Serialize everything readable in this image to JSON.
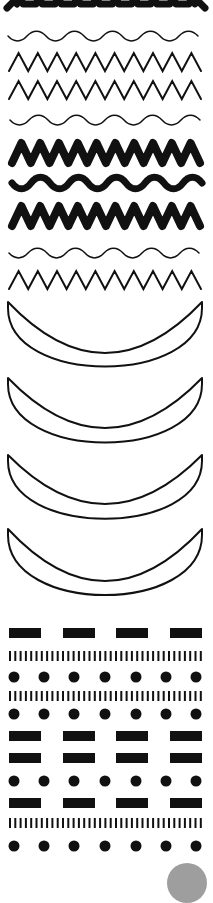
{
  "canvas": {
    "width": 213,
    "height": 875,
    "background": "#ffffff",
    "ink": "#111111",
    "accent_gray": "#9e9e9e"
  },
  "patterns": [
    {
      "id": "thick-zigzag-cut",
      "type": "zigzag",
      "y": 10,
      "amp": 14,
      "periods": 10,
      "stroke": 7,
      "x0": 11,
      "x1": 201,
      "clipTop": true
    },
    {
      "id": "thin-wave-1",
      "type": "wave",
      "y": 36,
      "amp": 5,
      "periods": 5,
      "stroke": 1.5,
      "x0": 8,
      "x1": 198
    },
    {
      "id": "thin-zigzag-1",
      "type": "zigzag",
      "y": 62,
      "amp": 9,
      "periods": 10,
      "stroke": 2,
      "x0": 9,
      "x1": 201
    },
    {
      "id": "thin-zigzag-2",
      "type": "zigzag",
      "y": 90,
      "amp": 9,
      "periods": 10,
      "stroke": 2,
      "x0": 9,
      "x1": 201
    },
    {
      "id": "thin-wave-2",
      "type": "wave",
      "y": 120,
      "amp": 5,
      "periods": 5,
      "stroke": 1.5,
      "x0": 10,
      "x1": 200
    },
    {
      "id": "thick-zigzag-1",
      "type": "zigzag",
      "y": 153,
      "amp": 10,
      "periods": 10,
      "stroke": 8,
      "x0": 12,
      "x1": 200
    },
    {
      "id": "thick-wave",
      "type": "wave",
      "y": 183,
      "amp": 6,
      "periods": 5,
      "stroke": 7,
      "x0": 12,
      "x1": 202
    },
    {
      "id": "thick-zigzag-2",
      "type": "zigzag",
      "y": 216,
      "amp": 10,
      "periods": 10,
      "stroke": 8,
      "x0": 12,
      "x1": 200
    },
    {
      "id": "thin-wave-3",
      "type": "wave",
      "y": 253,
      "amp": 5,
      "periods": 5,
      "stroke": 1.5,
      "x0": 9,
      "x1": 199
    },
    {
      "id": "thin-zigzag-3",
      "type": "zigzag",
      "y": 280,
      "amp": 9,
      "periods": 10,
      "stroke": 2,
      "x0": 9,
      "x1": 201
    }
  ],
  "crescents": [
    {
      "id": "crescent-1",
      "top": 302,
      "inner_bottom": 353,
      "outer_bottom": 384
    },
    {
      "id": "crescent-2",
      "top": 378,
      "inner_bottom": 428,
      "outer_bottom": 460
    },
    {
      "id": "crescent-3",
      "top": 455,
      "inner_bottom": 504,
      "outer_bottom": 536
    },
    {
      "id": "crescent-4",
      "top": 529,
      "inner_bottom": 581,
      "outer_bottom": 613
    }
  ],
  "crescent_x": {
    "left": 8,
    "right": 202,
    "stroke": 2
  },
  "rows": [
    {
      "id": "dashes-1",
      "type": "dashes",
      "y": 628,
      "h": 10
    },
    {
      "id": "bars-1",
      "type": "bars",
      "y": 651,
      "h": 10
    },
    {
      "id": "dots-1",
      "type": "dots",
      "cy": 677,
      "r": 5.5
    },
    {
      "id": "bars-2",
      "type": "bars",
      "y": 691,
      "h": 10
    },
    {
      "id": "dots-2",
      "type": "dots",
      "cy": 714,
      "r": 5.5
    },
    {
      "id": "dashes-2",
      "type": "dashes",
      "y": 731,
      "h": 10
    },
    {
      "id": "dashes-3",
      "type": "dashes",
      "y": 753,
      "h": 10
    },
    {
      "id": "dots-3",
      "type": "dots",
      "cy": 781,
      "r": 5.5
    },
    {
      "id": "dashes-4",
      "type": "dashes",
      "y": 798,
      "h": 10
    },
    {
      "id": "bars-3",
      "type": "bars",
      "y": 818,
      "h": 10
    },
    {
      "id": "dots-4",
      "type": "dots",
      "cy": 846,
      "r": 5.5
    }
  ],
  "dash_x": [
    9,
    63,
    116,
    170
  ],
  "dash_w": 32,
  "dot_cx": [
    14,
    44,
    74,
    105,
    136,
    166,
    196
  ],
  "bars": {
    "x0": 9,
    "count": 37,
    "spacing": 5.3,
    "w": 2
  }
}
